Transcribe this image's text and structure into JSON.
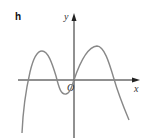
{
  "figure": {
    "panel_label": "h",
    "x_axis_label": "x",
    "y_axis_label": "y",
    "origin_label": "O",
    "curve_description": "Graph of a polynomial-like function: rises from bottom-left, local max left of y-axis, local min just left of origin below x-axis, passes through origin, local max right of y-axis, then falls to bottom-right",
    "colors": {
      "axis": "#222222",
      "curve": "#888888",
      "text": "#111111"
    }
  }
}
